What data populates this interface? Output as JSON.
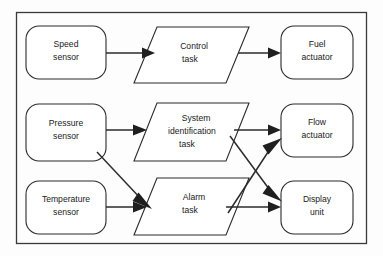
{
  "diagram": {
    "frame": {
      "name": "diagram-border",
      "stroke_color": "#3a3a3a"
    },
    "colors": {
      "background": "#fdfdfd",
      "shape_fill": "#ffffff",
      "shape_stroke": "#2b2b2b",
      "text": "#1a1a1a",
      "arrow": "#1f1f1f"
    },
    "nodes": [
      {
        "id": "speed-sensor",
        "shape": "rounded-rect",
        "lines": [
          "Speed",
          "sensor"
        ],
        "x": 26,
        "y": 26,
        "w": 80,
        "h": 53,
        "r": 13
      },
      {
        "id": "control-task",
        "shape": "parallelogram",
        "lines": [
          "Control",
          "task"
        ],
        "x": 134,
        "y": 27,
        "w": 115,
        "h": 56,
        "skew": 23
      },
      {
        "id": "fuel-actuator",
        "shape": "rounded-rect",
        "lines": [
          "Fuel",
          "actuator"
        ],
        "x": 281,
        "y": 26,
        "w": 72,
        "h": 53,
        "r": 13
      },
      {
        "id": "pressure-sensor",
        "shape": "rounded-rect",
        "lines": [
          "Pressure",
          "sensor"
        ],
        "x": 26,
        "y": 104,
        "w": 80,
        "h": 57,
        "r": 13
      },
      {
        "id": "system-identification-task",
        "shape": "parallelogram",
        "lines": [
          "System",
          "identification",
          "task"
        ],
        "x": 134,
        "y": 103,
        "w": 115,
        "h": 58,
        "skew": 23
      },
      {
        "id": "flow-actuator",
        "shape": "rounded-rect",
        "lines": [
          "Flow",
          "actuator"
        ],
        "x": 281,
        "y": 104,
        "w": 72,
        "h": 53,
        "r": 13
      },
      {
        "id": "temperature-sensor",
        "shape": "rounded-rect",
        "lines": [
          "Temperature",
          "sensor"
        ],
        "x": 26,
        "y": 181,
        "w": 80,
        "h": 53,
        "r": 13
      },
      {
        "id": "alarm-task",
        "shape": "parallelogram",
        "lines": [
          "Alarm",
          "task"
        ],
        "x": 134,
        "y": 178,
        "w": 115,
        "h": 57,
        "skew": 23
      },
      {
        "id": "display-unit",
        "shape": "rounded-rect",
        "lines": [
          "Display",
          "unit"
        ],
        "x": 281,
        "y": 181,
        "w": 72,
        "h": 53,
        "r": 13
      }
    ],
    "edges": [
      {
        "id": "speed-to-control",
        "from": "speed-sensor",
        "to": "control-task"
      },
      {
        "id": "control-to-fuel",
        "from": "control-task",
        "to": "fuel-actuator"
      },
      {
        "id": "pressure-to-sysid",
        "from": "pressure-sensor",
        "to": "system-identification-task"
      },
      {
        "id": "pressure-to-alarm",
        "from": "pressure-sensor",
        "to": "alarm-task"
      },
      {
        "id": "temperature-to-alarm",
        "from": "temperature-sensor",
        "to": "alarm-task"
      },
      {
        "id": "sysid-to-flow",
        "from": "system-identification-task",
        "to": "flow-actuator"
      },
      {
        "id": "sysid-to-display",
        "from": "system-identification-task",
        "to": "display-unit"
      },
      {
        "id": "alarm-to-flow",
        "from": "alarm-task",
        "to": "flow-actuator"
      },
      {
        "id": "alarm-to-display",
        "from": "alarm-task",
        "to": "display-unit"
      }
    ]
  }
}
